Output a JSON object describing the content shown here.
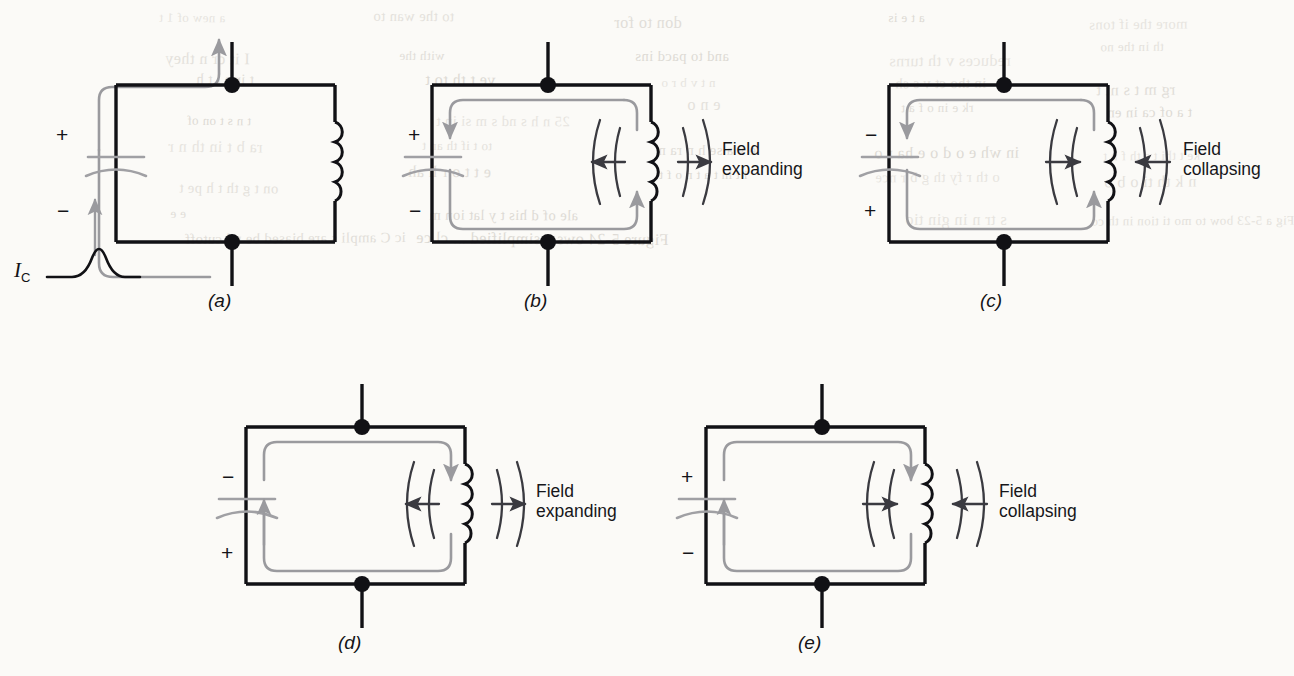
{
  "figure": {
    "type": "circuit-diagram-series",
    "background_color": "#fbfaf7",
    "wire_color": "#111115",
    "current_color": "#9a9a9e",
    "field_color": "#3a3a40"
  },
  "source_label": {
    "symbol": "I",
    "subscript": "C",
    "waveform": "single-pulse"
  },
  "panels": [
    {
      "id": "a",
      "caption": "(a)",
      "polarity_top": "+",
      "polarity_bottom": "−",
      "field_label": "",
      "field_state": "none",
      "current": "external-charging-pulse"
    },
    {
      "id": "b",
      "caption": "(b)",
      "polarity_top": "+",
      "polarity_bottom": "−",
      "field_label": "Field\nexpanding",
      "field_state": "expanding",
      "current": "clockwise-internal"
    },
    {
      "id": "c",
      "caption": "(c)",
      "polarity_top": "−",
      "polarity_bottom": "+",
      "field_label": "Field\ncollapsing",
      "field_state": "collapsing",
      "current": "clockwise-internal"
    },
    {
      "id": "d",
      "caption": "(d)",
      "polarity_top": "−",
      "polarity_bottom": "+",
      "field_label": "Field\nexpanding",
      "field_state": "expanding",
      "current": "counterclockwise-internal"
    },
    {
      "id": "e",
      "caption": "(e)",
      "polarity_top": "+",
      "polarity_bottom": "−",
      "field_label": "Field\ncollapsing",
      "field_state": "collapsing",
      "current": "counterclockwise-internal"
    }
  ],
  "ghost_text": [
    "a new of 1 t",
    "to the wan to",
    "don to for",
    "a t e is",
    "more the if  tons",
    "I it cr n they",
    "with the",
    "and to  pacd ins",
    "reduces  v   th  turns",
    "th in  the  no",
    "t ir  e  l   t h",
    "ve t   th  to t",
    "n   t   v  b  r o",
    "in  tho  ct  v  s  sh",
    "rg    m  t    s  nt t",
    "t n   s   t  on  of",
    "25  n   h  s  nd  s  m  si  in t",
    "e   n   o",
    "rk  e   in  o f  a  t",
    "t a  of  ca  in  en",
    "ra  b t  in  th  n  r",
    "to  t   if   th  an  t",
    "e   v    a se  h  n   ra n",
    "in  wh  e   o  d  o  e   ha  r o",
    "ke   t  thi  t    s  th  f  n  t",
    "on  t   g   th   t  h  pe   t",
    "e   t  t   o  r  h   ah",
    "i   t    in  t  a   t   n  o  f   t",
    "o  th   r   fy  th  g  b  r  nce",
    "n  k     th   ti  o  b   o",
    "e   e",
    "ale of d   his  t  y  lat  ion  m",
    "s tr  n  in  gin  tio",
    "Fig  a  5-23  bow  to  mo  ti  tion  in th  co",
    "ic  C   ampli  s  are  biased  be  nd  cutoff",
    "Figure  5-24  ows  a  simplified  ...  cl  ce"
  ]
}
